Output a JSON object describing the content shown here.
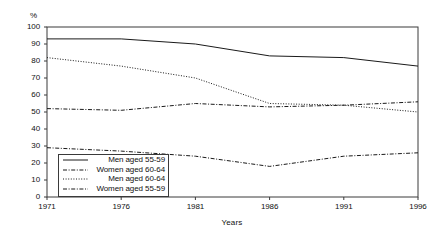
{
  "chart_data": {
    "type": "line",
    "title": "",
    "xlabel": "Years",
    "ylabel": "%",
    "x": [
      1971,
      1976,
      1981,
      1986,
      1991,
      1996
    ],
    "xtick_labels": [
      "1971",
      "1976",
      "1981",
      "1986",
      "1991",
      "1996"
    ],
    "ytick_labels": [
      "0",
      "10",
      "20",
      "30",
      "40",
      "50",
      "60",
      "70",
      "80",
      "90",
      "100"
    ],
    "ytick_values": [
      0,
      10,
      20,
      30,
      40,
      50,
      60,
      70,
      80,
      90,
      100
    ],
    "xlim": [
      1971,
      1996
    ],
    "ylim": [
      0,
      100
    ],
    "grid": false,
    "legend_position": "lower-left-inside",
    "series": [
      {
        "name": "Men aged 55-59",
        "style": "solid",
        "color": "#1a1a1a",
        "values": [
          93,
          93,
          90,
          83,
          82,
          77
        ]
      },
      {
        "name": "Women aged 60-64",
        "style": "dash-dot",
        "color": "#1a1a1a",
        "values": [
          52,
          51,
          55,
          53,
          54,
          56
        ]
      },
      {
        "name": "Men aged 60-64",
        "style": "dotted",
        "color": "#1a1a1a",
        "values": [
          82,
          77,
          70,
          55,
          54,
          50
        ]
      },
      {
        "name": "Women aged 55-59",
        "style": "dash-dot",
        "color": "#1a1a1a",
        "values": [
          29,
          27,
          24,
          18,
          24,
          26
        ]
      }
    ]
  },
  "axes": {
    "y_unit": "%",
    "x_title": "Years"
  },
  "legend": {
    "entries": [
      {
        "label": "Men aged 55-59"
      },
      {
        "label": "Women aged 60-64"
      },
      {
        "label": "Men aged 60-64"
      },
      {
        "label": "Women aged 55-59"
      }
    ]
  }
}
